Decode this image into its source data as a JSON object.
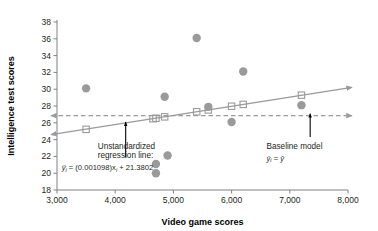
{
  "chart_data": {
    "type": "scatter",
    "title": "",
    "xlabel": "Video game scores",
    "ylabel": "Intelligence test scores",
    "xlim": [
      3000,
      8000
    ],
    "ylim": [
      18,
      38
    ],
    "xticks": [
      3000,
      4000,
      5000,
      6000,
      7000,
      8000
    ],
    "xtick_labels": [
      "3,000",
      "4,000",
      "5,000",
      "6,000",
      "7,000",
      "8,000"
    ],
    "yticks": [
      18,
      20,
      22,
      24,
      26,
      28,
      30,
      32,
      34,
      36,
      38
    ],
    "ytick_labels": [
      "18",
      "20",
      "22",
      "24",
      "26",
      "28",
      "30",
      "32",
      "34",
      "36",
      "38"
    ],
    "grid": false,
    "legend": "none",
    "series": [
      {
        "name": "Observed scores",
        "marker": "filled-circle",
        "color": "#9a9a9a",
        "points": [
          {
            "x": 3500,
            "y": 30.1
          },
          {
            "x": 4700,
            "y": 21.1
          },
          {
            "x": 4700,
            "y": 20.0
          },
          {
            "x": 4850,
            "y": 29.1
          },
          {
            "x": 4900,
            "y": 22.1
          },
          {
            "x": 5400,
            "y": 36.1
          },
          {
            "x": 5600,
            "y": 27.9
          },
          {
            "x": 6000,
            "y": 26.1
          },
          {
            "x": 6200,
            "y": 32.1
          },
          {
            "x": 7200,
            "y": 28.1
          }
        ]
      },
      {
        "name": "Predicted scores",
        "marker": "open-square",
        "color": "#9a9a9a",
        "points": [
          {
            "x": 3500,
            "y": 25.22
          },
          {
            "x": 4650,
            "y": 26.49
          },
          {
            "x": 4700,
            "y": 26.54
          },
          {
            "x": 4850,
            "y": 26.71
          },
          {
            "x": 5400,
            "y": 27.31
          },
          {
            "x": 5600,
            "y": 27.53
          },
          {
            "x": 6000,
            "y": 27.97
          },
          {
            "x": 6200,
            "y": 28.19
          },
          {
            "x": 7200,
            "y": 29.29
          }
        ]
      }
    ],
    "lines": [
      {
        "name": "Unstandardized regression line",
        "type": "solid-arrow-both",
        "color": "#9a9a9a",
        "slope": 0.001098,
        "intercept": 21.3802,
        "x_start": 3000,
        "x_end": 8000,
        "y_start": 24.67,
        "y_end": 30.16
      },
      {
        "name": "Baseline model",
        "type": "dashed-arrow-both",
        "color": "#9a9a9a",
        "constant_y": 26.85,
        "x_start": 3000,
        "x_end": 8000
      }
    ],
    "annotations": [
      {
        "name": "regression-annotation",
        "line1": "Unstandardized",
        "line2": "regression line:",
        "equation_prefix": "y",
        "equation_sub1": "i",
        "equation_mid": " = (0.001098)x",
        "equation_sub2": "i",
        "equation_suffix": " + 21.3802",
        "arrow_target_x": 4180,
        "arrow_target_y": 26.1
      },
      {
        "name": "baseline-annotation",
        "line1": "Baseline model",
        "equation_prefix": "y",
        "equation_sub1": "i",
        "equation_mid": " = ",
        "equation_suffix": "y",
        "arrow_target_x": 7350,
        "arrow_target_y": 26.85
      }
    ],
    "colors": {
      "marker": "#9a9a9a",
      "line": "#9a9a9a",
      "axis": "#808080",
      "text": "#231f20",
      "annotation_arrow": "#000000"
    }
  }
}
